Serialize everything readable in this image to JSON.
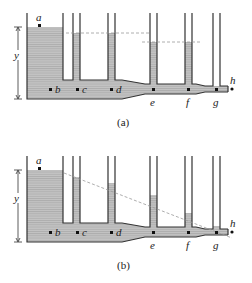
{
  "figure": {
    "panels": [
      {
        "caption": "(a)",
        "dimension_label": "y",
        "points": {
          "a": "a",
          "b": "b",
          "c": "c",
          "d": "d",
          "e": "e",
          "f": "f",
          "g": "g",
          "h": "h"
        },
        "description": "No flow: fluid levels in all standpipes equal the tank level (dashed horizontal line)"
      },
      {
        "caption": "(b)",
        "dimension_label": "y",
        "points": {
          "a": "a",
          "b": "b",
          "c": "c",
          "d": "d",
          "e": "e",
          "f": "f",
          "g": "g",
          "h": "h"
        },
        "description": "Flow: standpipe fluid levels decrease along the pipe (sloped dashed line)"
      }
    ],
    "colors": {
      "fluid": "#b8b8b8",
      "fluid_lines": "#9a9a9a",
      "walls": "#333333",
      "dashed": "#999999"
    }
  }
}
